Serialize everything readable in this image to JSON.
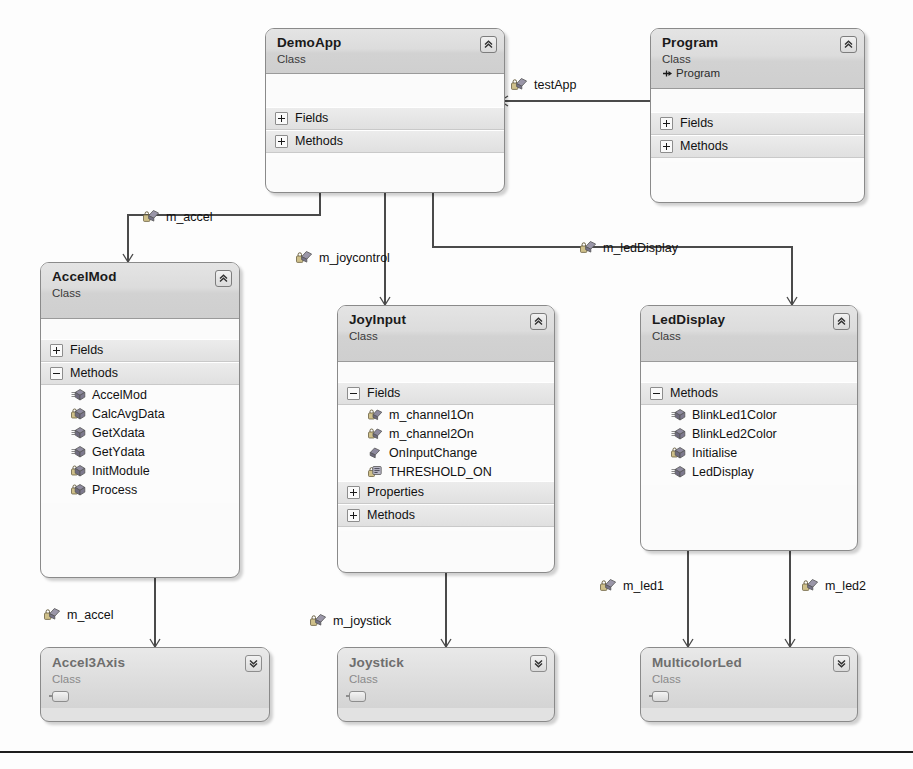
{
  "diagram": {
    "background_color": "#fdfdfd",
    "box_border_color": "#8a8a8a",
    "header_gradient_top": "#e4e4e4",
    "header_gradient_bottom": "#cfcfcf",
    "connector_color": "#4a4a4a"
  },
  "classes": [
    {
      "id": "demoapp",
      "name": "DemoApp",
      "kind": "Class",
      "base": null,
      "collapse_icon": "chevron-double-up-icon",
      "state": "expanded",
      "compartments": [
        {
          "label": "Fields",
          "expanded": false,
          "toggle_icon": "plus-icon",
          "members": []
        },
        {
          "label": "Methods",
          "expanded": false,
          "toggle_icon": "plus-icon",
          "members": []
        }
      ]
    },
    {
      "id": "program",
      "name": "Program",
      "kind": "Class",
      "base": "Program",
      "base_icon": "arrow-right-small-icon",
      "collapse_icon": "chevron-double-up-icon",
      "state": "expanded",
      "compartments": [
        {
          "label": "Fields",
          "expanded": false,
          "toggle_icon": "plus-icon",
          "members": []
        },
        {
          "label": "Methods",
          "expanded": false,
          "toggle_icon": "plus-icon",
          "members": []
        }
      ]
    },
    {
      "id": "accelmod",
      "name": "AccelMod",
      "kind": "Class",
      "base": null,
      "collapse_icon": "chevron-double-up-icon",
      "state": "expanded",
      "compartments": [
        {
          "label": "Fields",
          "expanded": false,
          "toggle_icon": "plus-icon",
          "members": []
        },
        {
          "label": "Methods",
          "expanded": true,
          "toggle_icon": "minus-icon",
          "members": [
            {
              "name": "AccelMod",
              "icon": "public-method-icon",
              "visibility": "public"
            },
            {
              "name": "CalcAvgData",
              "icon": "private-method-icon",
              "visibility": "private"
            },
            {
              "name": "GetXdata",
              "icon": "public-method-icon",
              "visibility": "public"
            },
            {
              "name": "GetYdata",
              "icon": "public-method-icon",
              "visibility": "public"
            },
            {
              "name": "InitModule",
              "icon": "private-method-icon",
              "visibility": "private"
            },
            {
              "name": "Process",
              "icon": "private-method-icon",
              "visibility": "private"
            }
          ]
        }
      ]
    },
    {
      "id": "joyinput",
      "name": "JoyInput",
      "kind": "Class",
      "base": null,
      "collapse_icon": "chevron-double-up-icon",
      "state": "expanded",
      "compartments": [
        {
          "label": "Fields",
          "expanded": true,
          "toggle_icon": "minus-icon",
          "members": [
            {
              "name": "m_channel1On",
              "icon": "private-field-icon",
              "visibility": "private"
            },
            {
              "name": "m_channel2On",
              "icon": "private-field-icon",
              "visibility": "private"
            },
            {
              "name": "OnInputChange",
              "icon": "public-field-icon",
              "visibility": "public"
            },
            {
              "name": "THRESHOLD_ON",
              "icon": "private-const-icon",
              "visibility": "private"
            }
          ]
        },
        {
          "label": "Properties",
          "expanded": false,
          "toggle_icon": "plus-icon",
          "members": []
        },
        {
          "label": "Methods",
          "expanded": false,
          "toggle_icon": "plus-icon",
          "members": []
        }
      ]
    },
    {
      "id": "leddisplay",
      "name": "LedDisplay",
      "kind": "Class",
      "base": null,
      "collapse_icon": "chevron-double-up-icon",
      "state": "expanded",
      "compartments": [
        {
          "label": "Methods",
          "expanded": true,
          "toggle_icon": "minus-icon",
          "members": [
            {
              "name": "BlinkLed1Color",
              "icon": "public-method-icon",
              "visibility": "public"
            },
            {
              "name": "BlinkLed2Color",
              "icon": "public-method-icon",
              "visibility": "public"
            },
            {
              "name": "Initialise",
              "icon": "private-method-icon",
              "visibility": "private"
            },
            {
              "name": "LedDisplay",
              "icon": "public-method-icon",
              "visibility": "public"
            }
          ]
        }
      ]
    },
    {
      "id": "accel3axis",
      "name": "Accel3Axis",
      "kind": "Class",
      "base": null,
      "collapse_icon": "chevron-double-down-icon",
      "state": "collapsed",
      "compartments": []
    },
    {
      "id": "joystick",
      "name": "Joystick",
      "kind": "Class",
      "base": null,
      "collapse_icon": "chevron-double-down-icon",
      "state": "collapsed",
      "compartments": []
    },
    {
      "id": "multicolorled",
      "name": "MulticolorLed",
      "kind": "Class",
      "base": null,
      "collapse_icon": "chevron-double-down-icon",
      "state": "collapsed",
      "compartments": []
    }
  ],
  "associations": [
    {
      "id": "testapp",
      "label": "testApp",
      "icon": "private-field-icon",
      "from": "program",
      "to": "demoapp"
    },
    {
      "id": "m_accel_top",
      "label": "m_accel",
      "icon": "private-field-icon",
      "from": "demoapp",
      "to": "accelmod"
    },
    {
      "id": "m_joycontrol",
      "label": "m_joycontrol",
      "icon": "private-field-icon",
      "from": "demoapp",
      "to": "joyinput"
    },
    {
      "id": "m_leddisplay",
      "label": "m_ledDisplay",
      "icon": "private-field-icon",
      "from": "demoapp",
      "to": "leddisplay"
    },
    {
      "id": "m_accel_bot",
      "label": "m_accel",
      "icon": "private-field-icon",
      "from": "accelmod",
      "to": "accel3axis"
    },
    {
      "id": "m_joystick",
      "label": "m_joystick",
      "icon": "private-field-icon",
      "from": "joyinput",
      "to": "joystick"
    },
    {
      "id": "m_led1",
      "label": "m_led1",
      "icon": "private-field-icon",
      "from": "leddisplay",
      "to": "multicolorled"
    },
    {
      "id": "m_led2",
      "label": "m_led2",
      "icon": "private-field-icon",
      "from": "leddisplay",
      "to": "multicolorled"
    }
  ]
}
